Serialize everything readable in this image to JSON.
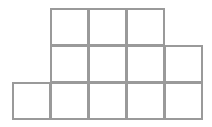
{
  "diagram": {
    "type": "square-grid-figure",
    "cell_size": 38,
    "origin": {
      "x": 13,
      "y": 9
    },
    "line_color": "#9a9a9a",
    "fill_color": "#ffffff",
    "rows": [
      {
        "row": 0,
        "columns": [
          1,
          2,
          3
        ]
      },
      {
        "row": 1,
        "columns": [
          1,
          2,
          3,
          4
        ]
      },
      {
        "row": 2,
        "columns": [
          0,
          1,
          2,
          3,
          4
        ]
      }
    ],
    "total_squares": 12
  }
}
